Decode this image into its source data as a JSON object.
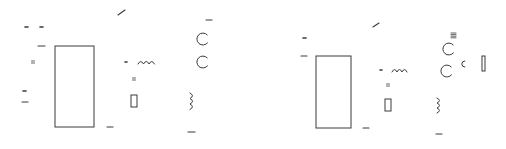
{
  "diagram": {
    "type": "schematic-fragments",
    "stroke_color": "#3a3a3a",
    "background": "#ffffff",
    "panels": [
      {
        "id": "left",
        "components": [
          {
            "kind": "line",
            "name": "diagonal-wire",
            "x1": 118,
            "y1": 15,
            "x2": 125,
            "y2": 10
          },
          {
            "kind": "dash",
            "name": "mark",
            "x": 25,
            "y": 27,
            "w": 3
          },
          {
            "kind": "dash",
            "name": "mark",
            "x": 40,
            "y": 27,
            "w": 3
          },
          {
            "kind": "line",
            "name": "terminal-dash",
            "x1": 38,
            "y1": 46,
            "x2": 45,
            "y2": 46
          },
          {
            "kind": "equals",
            "name": "label-mark",
            "x": 33,
            "y": 62
          },
          {
            "kind": "rect",
            "name": "main-block",
            "x": 55,
            "y": 46,
            "w": 39,
            "h": 81
          },
          {
            "kind": "dash",
            "name": "mark",
            "x": 23,
            "y": 91,
            "w": 3
          },
          {
            "kind": "line",
            "name": "terminal-dash",
            "x1": 22,
            "y1": 102,
            "x2": 28,
            "y2": 102
          },
          {
            "kind": "line",
            "name": "terminal-dash",
            "x1": 107,
            "y1": 127,
            "x2": 113,
            "y2": 127
          },
          {
            "kind": "dash",
            "name": "mark",
            "x": 125,
            "y": 62,
            "w": 2
          },
          {
            "kind": "inductor-h",
            "name": "inductor",
            "x": 138,
            "y": 62,
            "loops": 3,
            "loop_w": 5.5
          },
          {
            "kind": "equals",
            "name": "label-mark",
            "x": 134,
            "y": 79
          },
          {
            "kind": "rect",
            "name": "resistor",
            "x": 131,
            "y": 95,
            "w": 6,
            "h": 12
          },
          {
            "kind": "line",
            "name": "terminal-dash",
            "x1": 206,
            "y1": 20,
            "x2": 212,
            "y2": 20
          },
          {
            "kind": "circle-open",
            "name": "terminal-circle",
            "cx": 203,
            "cy": 39,
            "r": 6
          },
          {
            "kind": "circle-open",
            "name": "terminal-circle",
            "cx": 203,
            "cy": 62,
            "r": 6
          },
          {
            "kind": "inductor-v",
            "name": "coil",
            "x": 190,
            "y": 93,
            "loops": 3,
            "loop_h": 5.5
          },
          {
            "kind": "line",
            "name": "terminal-dash",
            "x1": 188,
            "y1": 132,
            "x2": 195,
            "y2": 132
          }
        ]
      },
      {
        "id": "right",
        "components": [
          {
            "kind": "line",
            "name": "diagonal-wire",
            "x1": 373,
            "y1": 27,
            "x2": 379,
            "y2": 23
          },
          {
            "kind": "dash",
            "name": "mark",
            "x": 303,
            "y": 38,
            "w": 3
          },
          {
            "kind": "line",
            "name": "terminal-dash",
            "x1": 301,
            "y1": 56,
            "x2": 307,
            "y2": 56
          },
          {
            "kind": "rect",
            "name": "main-block",
            "x": 316,
            "y": 56,
            "w": 35,
            "h": 72
          },
          {
            "kind": "line",
            "name": "terminal-dash",
            "x1": 363,
            "y1": 128,
            "x2": 369,
            "y2": 128
          },
          {
            "kind": "dash",
            "name": "mark",
            "x": 380,
            "y": 70,
            "w": 2
          },
          {
            "kind": "inductor-h",
            "name": "inductor",
            "x": 392,
            "y": 70,
            "loops": 3,
            "loop_w": 5
          },
          {
            "kind": "equals",
            "name": "label-mark",
            "x": 388,
            "y": 85
          },
          {
            "kind": "rect",
            "name": "resistor",
            "x": 385,
            "y": 99,
            "w": 6,
            "h": 12
          },
          {
            "kind": "triple-bar",
            "name": "label-mark",
            "x": 451,
            "y": 33
          },
          {
            "kind": "circle-open",
            "name": "terminal-circle",
            "cx": 449,
            "cy": 49,
            "r": 6
          },
          {
            "kind": "circle-open",
            "name": "terminal-circle",
            "cx": 447,
            "cy": 71,
            "r": 6
          },
          {
            "kind": "arc-c",
            "name": "partial-arc",
            "cx": 463,
            "cy": 64,
            "r": 3
          },
          {
            "kind": "rect",
            "name": "capacitor-plate",
            "x": 482,
            "y": 56,
            "w": 3,
            "h": 15
          },
          {
            "kind": "inductor-v",
            "name": "coil",
            "x": 437,
            "y": 98,
            "loops": 3,
            "loop_h": 5
          },
          {
            "kind": "line",
            "name": "terminal-dash",
            "x1": 436,
            "y1": 134,
            "x2": 442,
            "y2": 134
          }
        ]
      }
    ]
  }
}
